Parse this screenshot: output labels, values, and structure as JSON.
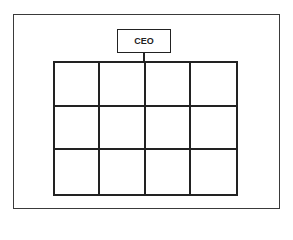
{
  "diagram": {
    "type": "org-chart-matrix",
    "root": {
      "label": "CEO"
    },
    "grid": {
      "rows": 3,
      "columns": 4,
      "cells": [
        [
          "",
          "",
          "",
          ""
        ],
        [
          "",
          "",
          "",
          ""
        ],
        [
          "",
          "",
          "",
          ""
        ]
      ]
    },
    "colors": {
      "line": "#222222",
      "background": "#ffffff"
    }
  }
}
